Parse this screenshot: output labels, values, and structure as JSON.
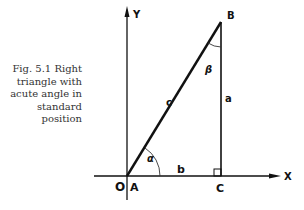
{
  "caption": {
    "lines": [
      "Fig. 5.1   Right",
      "triangle with",
      "acute angle in",
      "standard",
      "position"
    ]
  },
  "diagram": {
    "axes": {
      "x_label": "X",
      "y_label": "Y",
      "origin_label": "O"
    },
    "vertices": {
      "A": "A",
      "B": "B",
      "C": "C"
    },
    "sides": {
      "hypotenuse": "c",
      "vertical": "a",
      "horizontal": "b"
    },
    "angles": {
      "at_A": "α",
      "at_B": "β"
    },
    "right_angle_at": "C",
    "color": "#111111"
  }
}
